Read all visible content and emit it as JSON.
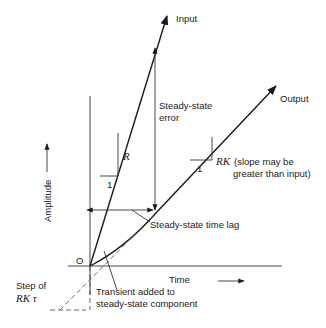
{
  "diagram": {
    "labels": {
      "input": "Input",
      "output": "Output",
      "steady_state_error_1": "Steady-state",
      "steady_state_error_2": "error",
      "input_slope": "R",
      "input_slope_run": "1",
      "output_slope": "RK",
      "output_slope_note_1": "(slope may be",
      "output_slope_note_2": "greater than input)",
      "output_slope_run": "1",
      "time_lag": "Steady-state time lag",
      "y_axis": "Amplitude",
      "x_axis": "Time",
      "origin": "O",
      "step_1": "Step of",
      "step_2": "RK τ",
      "transient_1": "Transient added to",
      "transient_2": "steady-state component"
    }
  }
}
